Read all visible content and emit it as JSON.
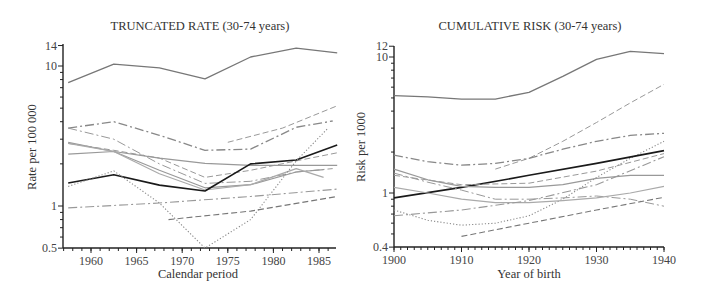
{
  "chart_data": [
    {
      "type": "line",
      "title": "TRUNCATED RATE (30-74 years)",
      "xlabel": "Calendar period",
      "ylabel": "Rate per 100 000",
      "yscale": "log",
      "ylim": [
        0.5,
        14
      ],
      "xlim": [
        1957,
        1987
      ],
      "xticks": [
        "1960",
        "1965",
        "1970",
        "1975",
        "1980",
        "1985"
      ],
      "yticks": [
        "0.5",
        "1",
        "10",
        "14"
      ],
      "grid": false,
      "series": [
        {
          "name": "top-solid",
          "style": "solid",
          "color": "#777777",
          "width": 1.3,
          "x": [
            1957.5,
            1962.5,
            1967.5,
            1972.5,
            1977.5,
            1982.5,
            1987.0
          ],
          "values": [
            7.6,
            10.3,
            9.7,
            8.1,
            11.6,
            13.4,
            12.4
          ]
        },
        {
          "name": "dashdot-upper",
          "style": "dashdot",
          "color": "#888888",
          "width": 1.3,
          "x": [
            1957.5,
            1962.5,
            1967.5,
            1972.5,
            1977.5,
            1982.5,
            1986.5
          ],
          "values": [
            3.6,
            4.0,
            3.2,
            2.5,
            2.55,
            3.65,
            4.05
          ]
        },
        {
          "name": "dashed-rising-light",
          "style": "dashed",
          "color": "#999999",
          "width": 1.0,
          "x": [
            1975.0,
            1981.0,
            1987.0
          ],
          "values": [
            2.85,
            3.6,
            5.2
          ]
        },
        {
          "name": "dashdot-declining",
          "style": "dashdot",
          "color": "#999999",
          "width": 1.0,
          "x": [
            1957.5,
            1962.5,
            1967.5,
            1972.5,
            1977.5,
            1982.5,
            1986.5
          ],
          "values": [
            3.6,
            3.0,
            2.0,
            1.45,
            1.5,
            1.75,
            1.85
          ]
        },
        {
          "name": "solid-declining-a",
          "style": "solid",
          "color": "#999999",
          "width": 1.2,
          "x": [
            1957.5,
            1962.5,
            1967.5,
            1972.5,
            1977.5,
            1982.5,
            1985.5
          ],
          "values": [
            2.85,
            2.45,
            1.8,
            1.35,
            1.42,
            1.75,
            1.82
          ]
        },
        {
          "name": "solid-flat",
          "style": "solid",
          "color": "#999999",
          "width": 1.2,
          "x": [
            1957.5,
            1962.5,
            1967.5,
            1972.5,
            1977.5,
            1982.5,
            1987.0
          ],
          "values": [
            2.35,
            2.45,
            2.2,
            2.02,
            1.95,
            1.95,
            1.95
          ]
        },
        {
          "name": "dashed-mid",
          "style": "dashed",
          "color": "#999999",
          "width": 1.0,
          "x": [
            1957.5,
            1962.5,
            1967.5,
            1972.5,
            1977.5,
            1982.5,
            1987.0
          ],
          "values": [
            2.8,
            2.5,
            2.2,
            1.6,
            1.8,
            2.1,
            2.4
          ]
        },
        {
          "name": "solid-declining-b",
          "style": "solid",
          "color": "#aaaaaa",
          "width": 1.2,
          "x": [
            1957.5,
            1962.5,
            1967.5,
            1972.5,
            1977.5,
            1982.5,
            1985.5
          ],
          "values": [
            2.8,
            2.45,
            1.7,
            1.3,
            1.42,
            1.85,
            1.6
          ]
        },
        {
          "name": "black-solid",
          "style": "solid",
          "color": "#1a1a1a",
          "width": 1.6,
          "x": [
            1957.5,
            1962.5,
            1967.5,
            1972.5,
            1977.5,
            1982.5,
            1987.0
          ],
          "values": [
            1.46,
            1.67,
            1.41,
            1.28,
            2.0,
            2.13,
            2.73
          ]
        },
        {
          "name": "dotted",
          "style": "dotted",
          "color": "#888888",
          "width": 1.1,
          "x": [
            1957.5,
            1962.5,
            1967.5,
            1972.5,
            1977.5,
            1982.5,
            1986.0
          ],
          "values": [
            1.38,
            1.78,
            1.05,
            0.5,
            0.8,
            2.1,
            3.6
          ]
        },
        {
          "name": "dashdot-low",
          "style": "dashdot",
          "color": "#999999",
          "width": 1.1,
          "x": [
            1957.5,
            1967.5,
            1977.5,
            1987.0
          ],
          "values": [
            0.97,
            1.05,
            1.17,
            1.32
          ]
        },
        {
          "name": "dashed-low",
          "style": "dashed",
          "color": "#777777",
          "width": 1.1,
          "x": [
            1968.5,
            1977.5,
            1987.0
          ],
          "values": [
            0.8,
            0.92,
            1.17
          ]
        }
      ]
    },
    {
      "type": "line",
      "title": "CUMULATIVE RISK (30-74 years)",
      "xlabel": "Year of birth",
      "ylabel": "Risk per 1000",
      "yscale": "log",
      "ylim": [
        0.4,
        12
      ],
      "xlim": [
        1900,
        1940
      ],
      "xticks": [
        "1900",
        "1910",
        "1920",
        "1930",
        "1940"
      ],
      "yticks": [
        "0.4",
        "1",
        "10",
        "12"
      ],
      "grid": false,
      "series": [
        {
          "name": "top-solid",
          "style": "solid",
          "color": "#777777",
          "width": 1.3,
          "x": [
            1900,
            1905,
            1910,
            1915,
            1920,
            1925,
            1930,
            1935,
            1940
          ],
          "values": [
            5.2,
            5.1,
            4.9,
            4.9,
            5.5,
            7.2,
            9.6,
            11.0,
            10.6
          ]
        },
        {
          "name": "dashed-rising-light",
          "style": "dashed",
          "color": "#999999",
          "width": 1.0,
          "x": [
            1915,
            1920,
            1925,
            1930,
            1935,
            1940
          ],
          "values": [
            1.5,
            1.8,
            2.4,
            3.3,
            4.6,
            6.3
          ]
        },
        {
          "name": "dashdot-upper",
          "style": "dashdot",
          "color": "#888888",
          "width": 1.3,
          "x": [
            1900,
            1905,
            1910,
            1915,
            1920,
            1925,
            1930,
            1935,
            1940
          ],
          "values": [
            1.9,
            1.7,
            1.6,
            1.65,
            1.8,
            2.1,
            2.4,
            2.65,
            2.75
          ]
        },
        {
          "name": "dotted",
          "style": "dotted",
          "color": "#888888",
          "width": 1.1,
          "x": [
            1900,
            1905,
            1910,
            1915,
            1920,
            1925,
            1930,
            1935,
            1940
          ],
          "values": [
            0.75,
            0.63,
            0.58,
            0.6,
            0.68,
            0.9,
            1.3,
            1.8,
            2.4
          ]
        },
        {
          "name": "black-solid",
          "style": "solid",
          "color": "#1a1a1a",
          "width": 1.6,
          "x": [
            1900,
            1910,
            1920,
            1930,
            1940
          ],
          "values": [
            0.92,
            1.1,
            1.35,
            1.65,
            2.05
          ]
        },
        {
          "name": "dashed-mid",
          "style": "dashed",
          "color": "#999999",
          "width": 1.0,
          "x": [
            1900,
            1910,
            1920,
            1930,
            1940
          ],
          "values": [
            1.35,
            1.15,
            1.18,
            1.45,
            1.95
          ]
        },
        {
          "name": "solid-declining-a",
          "style": "solid",
          "color": "#999999",
          "width": 1.2,
          "x": [
            1900,
            1905,
            1910,
            1915,
            1920,
            1925,
            1930,
            1935,
            1940
          ],
          "values": [
            1.5,
            1.25,
            1.12,
            1.1,
            1.1,
            1.15,
            1.28,
            1.35,
            1.35
          ]
        },
        {
          "name": "dashdot-declining",
          "style": "dashdot",
          "color": "#999999",
          "width": 1.0,
          "x": [
            1900,
            1905,
            1910,
            1915,
            1920,
            1925,
            1930,
            1935,
            1940
          ],
          "values": [
            1.4,
            1.2,
            1.05,
            0.9,
            0.9,
            0.92,
            0.95,
            0.9,
            0.8
          ]
        },
        {
          "name": "solid-declining-b",
          "style": "solid",
          "color": "#aaaaaa",
          "width": 1.2,
          "x": [
            1900,
            1905,
            1910,
            1915,
            1920,
            1925,
            1930,
            1935,
            1940
          ],
          "values": [
            1.1,
            1.0,
            0.9,
            0.85,
            0.85,
            0.88,
            0.92,
            1.0,
            1.12
          ]
        },
        {
          "name": "dashdot-low",
          "style": "dashdot",
          "color": "#999999",
          "width": 1.1,
          "x": [
            1900,
            1910,
            1920,
            1930,
            1940
          ],
          "values": [
            0.68,
            0.75,
            0.88,
            1.15,
            1.85
          ]
        },
        {
          "name": "dashed-low",
          "style": "dashed",
          "color": "#777777",
          "width": 1.1,
          "x": [
            1910,
            1920,
            1930,
            1940
          ],
          "values": [
            0.48,
            0.6,
            0.75,
            0.93
          ]
        }
      ]
    }
  ],
  "layout": {
    "panels": [
      {
        "plot": {
          "x0": 63,
          "x1": 336,
          "yTop": 44,
          "yBottom": 248
        },
        "xmap": {
          "a": 1960,
          "pa": 91,
          "b": 1985,
          "pb": 319
        },
        "ymap": {
          "v1": 1,
          "p1": 206,
          "v10": 10,
          "p10": 66
        },
        "tickXs": [
          1960,
          1965,
          1970,
          1975,
          1980,
          1985
        ],
        "minorStep": 1,
        "minorFrom": 1957,
        "minorTo": 1987,
        "yMajor": [
          0.5,
          1,
          10,
          14
        ],
        "yMinor": [
          0.6,
          0.7,
          0.8,
          0.9,
          2,
          3,
          4,
          5,
          6,
          7,
          8,
          9
        ]
      },
      {
        "plot": {
          "x0": 394,
          "x1": 664,
          "yTop": 46,
          "yBottom": 247
        },
        "xmap": {
          "a": 1900,
          "pa": 394,
          "b": 1940,
          "pb": 664
        },
        "ymap": {
          "v1": 1,
          "p1": 193,
          "v10": 10,
          "p10": 57
        },
        "tickXs": [
          1900,
          1910,
          1920,
          1930,
          1940
        ],
        "minorStep": 1,
        "minorFrom": 1900,
        "minorTo": 1940,
        "yMajor": [
          0.4,
          1,
          10,
          12
        ],
        "yMinor": [
          0.5,
          0.6,
          0.7,
          0.8,
          0.9,
          2,
          3,
          4,
          5,
          6,
          7,
          8,
          9
        ]
      }
    ]
  }
}
